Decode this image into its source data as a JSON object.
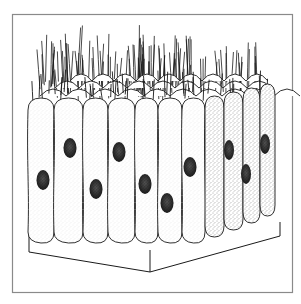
{
  "figure": {
    "frame_color": "#8a8a8a",
    "ink_color": "#1a1a1a",
    "background": "#ffffff",
    "front_cells": [
      {
        "x0": 28,
        "x1": 54,
        "nucleus": [
          43,
          180
        ]
      },
      {
        "x0": 54,
        "x1": 83,
        "nucleus": [
          70,
          148
        ]
      },
      {
        "x0": 83,
        "x1": 108,
        "nucleus": [
          96,
          189
        ]
      },
      {
        "x0": 108,
        "x1": 135,
        "nucleus": [
          119,
          152
        ]
      },
      {
        "x0": 135,
        "x1": 158,
        "nucleus": [
          145,
          184
        ]
      },
      {
        "x0": 158,
        "x1": 182,
        "nucleus": [
          167,
          203
        ]
      },
      {
        "x0": 182,
        "x1": 205,
        "nucleus": [
          190,
          167
        ]
      }
    ],
    "side_cells": [
      {
        "x0": 205,
        "x1": 224,
        "nucleus": null
      },
      {
        "x0": 224,
        "x1": 243,
        "nucleus": [
          229,
          150
        ]
      },
      {
        "x0": 243,
        "x1": 260,
        "nucleus": [
          246,
          174
        ]
      },
      {
        "x0": 260,
        "x1": 275,
        "nucleus": [
          265,
          144
        ]
      }
    ]
  }
}
